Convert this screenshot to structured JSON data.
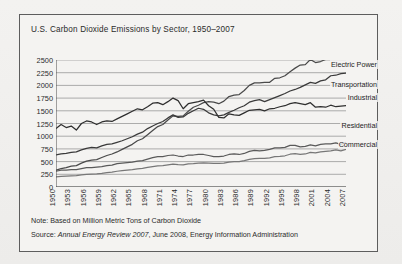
{
  "chart_data": {
    "type": "line",
    "title": "U.S. Carbon Dioxide Emissions by Sector, 1950–2007",
    "xlabel": "",
    "ylabel": "",
    "ylim": [
      0,
      2500
    ],
    "xlim": [
      1950,
      2007
    ],
    "grid": true,
    "legend_position": "right-inline",
    "yticks": [
      2500,
      2250,
      2000,
      1750,
      1500,
      1250,
      1000,
      750,
      500,
      250,
      0
    ],
    "xticks": [
      1950,
      1953,
      1956,
      1959,
      1962,
      1965,
      1968,
      1971,
      1974,
      1977,
      1980,
      1983,
      1986,
      1989,
      1992,
      1995,
      1998,
      2001,
      2004,
      2007
    ],
    "x": [
      1950,
      1951,
      1952,
      1953,
      1954,
      1955,
      1956,
      1957,
      1958,
      1959,
      1960,
      1961,
      1962,
      1963,
      1964,
      1965,
      1966,
      1967,
      1968,
      1969,
      1970,
      1971,
      1972,
      1973,
      1974,
      1975,
      1976,
      1977,
      1978,
      1979,
      1980,
      1981,
      1982,
      1983,
      1984,
      1985,
      1986,
      1987,
      1988,
      1989,
      1990,
      1991,
      1992,
      1993,
      1994,
      1995,
      1996,
      1997,
      1998,
      1999,
      2000,
      2001,
      2002,
      2003,
      2004,
      2005,
      2006,
      2007
    ],
    "series": [
      {
        "name": "Electric Power",
        "color": "#4a4a4a",
        "values": [
          330,
          360,
          380,
          410,
          420,
          470,
          510,
          530,
          540,
          580,
          620,
          650,
          690,
          740,
          790,
          840,
          910,
          950,
          1030,
          1110,
          1190,
          1230,
          1320,
          1400,
          1390,
          1400,
          1490,
          1570,
          1610,
          1660,
          1680,
          1670,
          1640,
          1690,
          1780,
          1810,
          1820,
          1900,
          2000,
          2050,
          2050,
          2060,
          2060,
          2140,
          2150,
          2190,
          2270,
          2340,
          2400,
          2410,
          2510,
          2450,
          2470,
          2510,
          2540,
          2600,
          2550,
          2600
        ]
      },
      {
        "name": "Transportation",
        "color": "#3a3a3a",
        "values": [
          630,
          650,
          660,
          680,
          690,
          730,
          760,
          780,
          770,
          810,
          840,
          850,
          880,
          910,
          950,
          990,
          1040,
          1080,
          1150,
          1200,
          1250,
          1290,
          1360,
          1420,
          1370,
          1380,
          1450,
          1500,
          1550,
          1530,
          1460,
          1420,
          1400,
          1420,
          1470,
          1510,
          1560,
          1600,
          1670,
          1700,
          1720,
          1680,
          1720,
          1760,
          1800,
          1840,
          1890,
          1920,
          1960,
          2010,
          2060,
          2040,
          2090,
          2110,
          2190,
          2200,
          2230,
          2240
        ]
      },
      {
        "name": "Industrial",
        "color": "#2f2f2f",
        "values": [
          1150,
          1230,
          1170,
          1200,
          1120,
          1250,
          1300,
          1280,
          1230,
          1280,
          1300,
          1290,
          1340,
          1390,
          1440,
          1490,
          1540,
          1520,
          1580,
          1650,
          1660,
          1620,
          1680,
          1750,
          1700,
          1540,
          1640,
          1660,
          1680,
          1710,
          1600,
          1530,
          1370,
          1360,
          1440,
          1420,
          1410,
          1460,
          1510,
          1520,
          1530,
          1500,
          1540,
          1550,
          1580,
          1600,
          1640,
          1660,
          1640,
          1620,
          1660,
          1570,
          1580,
          1570,
          1610,
          1580,
          1590,
          1600
        ]
      },
      {
        "name": "Residential",
        "color": "#5a5a5a",
        "values": [
          310,
          330,
          330,
          340,
          340,
          360,
          380,
          380,
          390,
          400,
          420,
          430,
          460,
          470,
          480,
          490,
          510,
          520,
          550,
          580,
          600,
          600,
          620,
          630,
          610,
          600,
          630,
          630,
          640,
          640,
          620,
          600,
          600,
          610,
          640,
          650,
          640,
          660,
          700,
          720,
          710,
          720,
          740,
          770,
          770,
          780,
          820,
          820,
          790,
          800,
          830,
          810,
          840,
          850,
          850,
          870,
          840,
          880
        ]
      },
      {
        "name": "Commercial",
        "color": "#777777",
        "values": [
          200,
          210,
          215,
          220,
          225,
          240,
          250,
          255,
          260,
          270,
          285,
          295,
          310,
          320,
          330,
          340,
          355,
          365,
          385,
          400,
          415,
          420,
          435,
          450,
          440,
          435,
          455,
          460,
          470,
          475,
          470,
          465,
          465,
          470,
          490,
          500,
          500,
          520,
          545,
          560,
          565,
          565,
          575,
          600,
          605,
          615,
          645,
          655,
          640,
          650,
          680,
          670,
          690,
          700,
          710,
          730,
          710,
          740
        ]
      }
    ]
  },
  "notes": {
    "note_prefix": "Note: ",
    "note_text": "Based on Million Metric Tons of Carbon Dioxide",
    "source_prefix": "Source: ",
    "source_italic": "Annual Energy Review 2007",
    "source_rest": ", June 2008, Energy Information Administration"
  }
}
